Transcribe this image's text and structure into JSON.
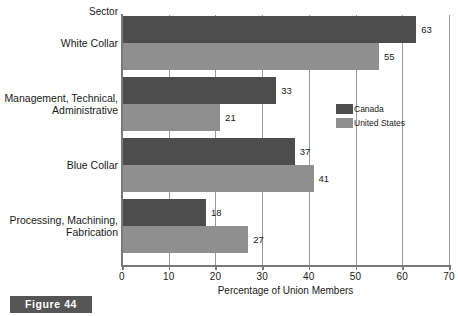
{
  "figure": {
    "caption": "Figure 44"
  },
  "chart_data": {
    "type": "bar",
    "orientation": "horizontal",
    "title": "",
    "xlabel": "Percentage of Union Members",
    "ylabel": "Sector",
    "xlim": [
      0,
      70
    ],
    "xticks": [
      0,
      10,
      20,
      30,
      40,
      50,
      60,
      70
    ],
    "grid": true,
    "grid_axis": "x",
    "legend_position": "inside-right",
    "categories": [
      "White Collar",
      "Management, Technical,\nAdministrative",
      "Blue Collar",
      "Processing, Machining,\nFabrication"
    ],
    "series": [
      {
        "name": "Canada",
        "color": "#4d4d4d",
        "values": [
          63,
          33,
          37,
          18
        ]
      },
      {
        "name": "United States",
        "color": "#8f8f8f",
        "values": [
          55,
          21,
          41,
          27
        ]
      }
    ]
  }
}
